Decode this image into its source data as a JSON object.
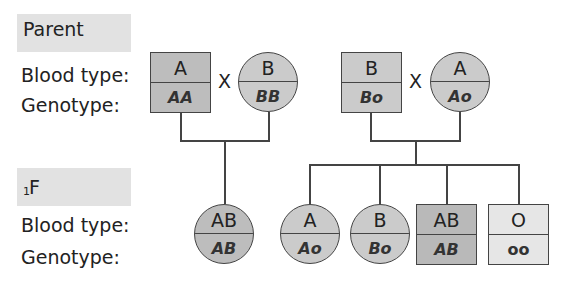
{
  "diagram": {
    "type": "pedigree",
    "colors": {
      "dark_gray": "#b9b9b9",
      "medium_gray": "#c9c9c9",
      "light_gray": "#e6e6e6",
      "label_bg": "#e2e2e2",
      "stroke": "#444444"
    },
    "parent_section": {
      "header": "Parent",
      "row_labels": {
        "blood_type": "Blood type:",
        "genotype": "Genotype:"
      },
      "cross_symbol": "X",
      "couples": [
        {
          "male": {
            "shape": "square",
            "blood_type": "A",
            "genotype": "AA"
          },
          "female": {
            "shape": "circle",
            "blood_type": "B",
            "genotype": "BB"
          }
        },
        {
          "male": {
            "shape": "square",
            "blood_type": "B",
            "genotype": "Bo"
          },
          "female": {
            "shape": "circle",
            "blood_type": "A",
            "genotype": "Ao"
          }
        }
      ]
    },
    "f1_section": {
      "header_main": "F",
      "header_sub": "1",
      "row_labels": {
        "blood_type": "Blood type:",
        "genotype": "Genotype:"
      },
      "offspring_couple1": [
        {
          "shape": "circle",
          "blood_type": "AB",
          "genotype": "AB"
        }
      ],
      "offspring_couple2": [
        {
          "shape": "circle",
          "blood_type": "A",
          "genotype": "Ao"
        },
        {
          "shape": "circle",
          "blood_type": "B",
          "genotype": "Bo"
        },
        {
          "shape": "square",
          "blood_type": "AB",
          "genotype": "AB"
        },
        {
          "shape": "square",
          "blood_type": "O",
          "genotype": "oo"
        }
      ]
    }
  }
}
